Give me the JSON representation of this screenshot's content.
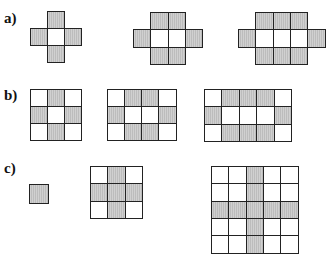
{
  "header": {
    "cropped_text": ""
  },
  "rows": [
    {
      "label": "a)",
      "top": 12
    },
    {
      "label": "b)",
      "top": 89
    },
    {
      "label": "c)",
      "top": 162
    }
  ],
  "colors": {
    "filled": "#c6c6c6",
    "empty": "#ffffff",
    "border": "#222222"
  },
  "figures": [
    {
      "id": "a1",
      "x": 30,
      "y": 11,
      "cell": 18.3,
      "cells": [
        [
          1,
          0,
          1
        ],
        [
          0,
          1,
          1
        ],
        [
          1,
          1,
          0
        ],
        [
          2,
          1,
          1
        ],
        [
          1,
          2,
          1
        ]
      ]
    },
    {
      "id": "a2",
      "x": 133,
      "y": 12,
      "cell": 18.5,
      "cells": [
        [
          1,
          0,
          1
        ],
        [
          2,
          0,
          1
        ],
        [
          0,
          1,
          1
        ],
        [
          1,
          1,
          0
        ],
        [
          2,
          1,
          0
        ],
        [
          3,
          1,
          1
        ],
        [
          1,
          2,
          1
        ],
        [
          2,
          2,
          1
        ]
      ]
    },
    {
      "id": "a3",
      "x": 238,
      "y": 12,
      "cell": 18.5,
      "cells": [
        [
          1,
          0,
          1
        ],
        [
          2,
          0,
          1
        ],
        [
          3,
          0,
          1
        ],
        [
          0,
          1,
          1
        ],
        [
          1,
          1,
          0
        ],
        [
          2,
          1,
          0
        ],
        [
          3,
          1,
          0
        ],
        [
          4,
          1,
          1
        ],
        [
          1,
          2,
          1
        ],
        [
          2,
          2,
          1
        ],
        [
          3,
          2,
          1
        ]
      ]
    },
    {
      "id": "b1",
      "x": 30,
      "y": 89,
      "cell": 18.3,
      "cells": [
        [
          0,
          0,
          0
        ],
        [
          1,
          0,
          1
        ],
        [
          2,
          0,
          0
        ],
        [
          0,
          1,
          1
        ],
        [
          1,
          1,
          0
        ],
        [
          2,
          1,
          1
        ],
        [
          0,
          2,
          0
        ],
        [
          1,
          2,
          1
        ],
        [
          2,
          2,
          0
        ]
      ]
    },
    {
      "id": "b2",
      "x": 107,
      "y": 89,
      "cell": 18.3,
      "cells": [
        [
          0,
          0,
          0
        ],
        [
          1,
          0,
          1
        ],
        [
          2,
          0,
          1
        ],
        [
          3,
          0,
          0
        ],
        [
          0,
          1,
          1
        ],
        [
          1,
          1,
          0
        ],
        [
          2,
          1,
          0
        ],
        [
          3,
          1,
          1
        ],
        [
          0,
          2,
          0
        ],
        [
          1,
          2,
          1
        ],
        [
          2,
          2,
          1
        ],
        [
          3,
          2,
          0
        ]
      ]
    },
    {
      "id": "b3",
      "x": 204,
      "y": 89,
      "cell": 18.6,
      "cells": [
        [
          0,
          0,
          0
        ],
        [
          1,
          0,
          1
        ],
        [
          2,
          0,
          1
        ],
        [
          3,
          0,
          1
        ],
        [
          4,
          0,
          0
        ],
        [
          0,
          1,
          1
        ],
        [
          1,
          1,
          0
        ],
        [
          2,
          1,
          0
        ],
        [
          3,
          1,
          0
        ],
        [
          4,
          1,
          1
        ],
        [
          0,
          2,
          0
        ],
        [
          1,
          2,
          1
        ],
        [
          2,
          2,
          1
        ],
        [
          3,
          2,
          1
        ],
        [
          4,
          2,
          0
        ]
      ]
    },
    {
      "id": "c1",
      "x": 29,
      "y": 184,
      "cell": 19.5,
      "cells": [
        [
          0,
          0,
          1
        ]
      ]
    },
    {
      "id": "c2",
      "x": 90,
      "y": 166,
      "cell": 18.5,
      "cells": [
        [
          0,
          0,
          0
        ],
        [
          1,
          0,
          1
        ],
        [
          2,
          0,
          0
        ],
        [
          0,
          1,
          1
        ],
        [
          1,
          1,
          1
        ],
        [
          2,
          1,
          1
        ],
        [
          0,
          2,
          0
        ],
        [
          1,
          2,
          1
        ],
        [
          2,
          2,
          0
        ]
      ]
    },
    {
      "id": "c3",
      "x": 211,
      "y": 166,
      "cell": 18.5,
      "cells": [
        [
          0,
          0,
          0
        ],
        [
          1,
          0,
          0
        ],
        [
          2,
          0,
          1
        ],
        [
          3,
          0,
          0
        ],
        [
          4,
          0,
          0
        ],
        [
          0,
          1,
          0
        ],
        [
          1,
          1,
          0
        ],
        [
          2,
          1,
          1
        ],
        [
          3,
          1,
          0
        ],
        [
          4,
          1,
          0
        ],
        [
          0,
          2,
          1
        ],
        [
          1,
          2,
          1
        ],
        [
          2,
          2,
          1
        ],
        [
          3,
          2,
          1
        ],
        [
          4,
          2,
          1
        ],
        [
          0,
          3,
          0
        ],
        [
          1,
          3,
          0
        ],
        [
          2,
          3,
          1
        ],
        [
          3,
          3,
          0
        ],
        [
          4,
          3,
          0
        ],
        [
          0,
          4,
          0
        ],
        [
          1,
          4,
          0
        ],
        [
          2,
          4,
          1
        ],
        [
          3,
          4,
          0
        ],
        [
          4,
          4,
          0
        ]
      ]
    }
  ]
}
